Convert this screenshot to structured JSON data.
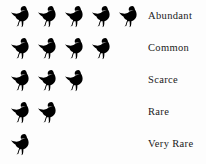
{
  "chart_data": {
    "type": "pictogram",
    "title": "",
    "subtitle": "",
    "xlabel": "",
    "ylabel": "",
    "icon": "bird-icon",
    "icon_unit_value": 1,
    "icon_color": "#000000",
    "background_color": "#fdfdfd",
    "label_color": "#1a1a1a",
    "legend_position": "right",
    "grid": false,
    "categories": [
      "Abundant",
      "Common",
      "Scarce",
      "Rare",
      "Very Rare"
    ],
    "values": [
      5,
      4,
      3,
      2,
      1
    ],
    "max_value": 5,
    "rows": [
      {
        "label": "Abundant",
        "count": 5
      },
      {
        "label": "Common",
        "count": 4
      },
      {
        "label": "Scarce",
        "count": 3
      },
      {
        "label": "Rare",
        "count": 2
      },
      {
        "label": "Very Rare",
        "count": 1
      }
    ]
  },
  "legend": {
    "rows": [
      {
        "label": "Abundant",
        "count": 5
      },
      {
        "label": "Common",
        "count": 4
      },
      {
        "label": "Scarce",
        "count": 3
      },
      {
        "label": "Rare",
        "count": 2
      },
      {
        "label": "Very Rare",
        "count": 1
      }
    ]
  }
}
